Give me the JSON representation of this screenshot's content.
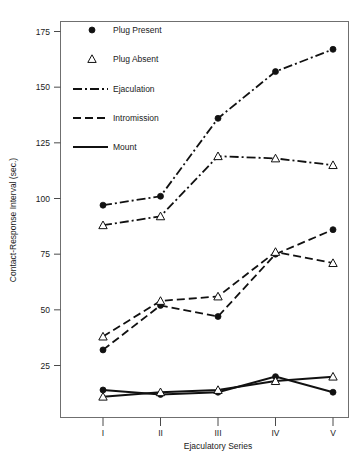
{
  "chart_data": {
    "type": "line",
    "title": "",
    "xlabel": "Ejaculatory Series",
    "ylabel": "Contact-Response Interval (sec.)",
    "categories": [
      "I",
      "II",
      "III",
      "IV",
      "V"
    ],
    "x_tick_labels": [
      "I",
      "II",
      "III",
      "IV",
      "V"
    ],
    "y_tick_labels": [
      "25",
      "50",
      "75",
      "100",
      "125",
      "150",
      "175"
    ],
    "y_ticks": [
      25,
      50,
      75,
      100,
      125,
      150,
      175
    ],
    "ylim": [
      0,
      185
    ],
    "grid": false,
    "legend_position": "top-left",
    "legend": [
      {
        "label": "Plug Present",
        "marker": "filled-circle"
      },
      {
        "label": "Plug Absent",
        "marker": "open-triangle"
      },
      {
        "label": "Ejaculation",
        "line": "dash-dot"
      },
      {
        "label": "Intromission",
        "line": "dashed"
      },
      {
        "label": "Mount",
        "line": "solid"
      }
    ],
    "series": [
      {
        "name": "Ejaculation - Plug Present",
        "behavior": "Ejaculation",
        "condition": "Plug Present",
        "marker": "filled-circle",
        "line": "dash-dot",
        "values": [
          97,
          101,
          136,
          157,
          167
        ]
      },
      {
        "name": "Ejaculation - Plug Absent",
        "behavior": "Ejaculation",
        "condition": "Plug Absent",
        "marker": "open-triangle",
        "line": "dash-dot",
        "values": [
          88,
          92,
          119,
          118,
          115
        ]
      },
      {
        "name": "Intromission - Plug Present",
        "behavior": "Intromission",
        "condition": "Plug Present",
        "marker": "filled-circle",
        "line": "dashed",
        "values": [
          32,
          52,
          47,
          75,
          86
        ]
      },
      {
        "name": "Intromission - Plug Absent",
        "behavior": "Intromission",
        "condition": "Plug Absent",
        "marker": "open-triangle",
        "line": "dashed",
        "values": [
          38,
          54,
          56,
          76,
          71
        ]
      },
      {
        "name": "Mount - Plug Present",
        "behavior": "Mount",
        "condition": "Plug Present",
        "marker": "filled-circle",
        "line": "solid",
        "values": [
          14,
          12,
          13,
          20,
          13
        ]
      },
      {
        "name": "Mount - Plug Absent",
        "behavior": "Mount",
        "condition": "Plug Absent",
        "marker": "open-triangle",
        "line": "solid",
        "values": [
          11,
          13,
          14,
          18,
          20
        ]
      }
    ]
  }
}
